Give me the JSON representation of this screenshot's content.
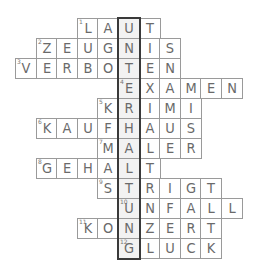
{
  "puzzle": {
    "grid_origin": {
      "x": 15,
      "y": 18
    },
    "cell_size": 20.6,
    "solution_column": 5,
    "solution_word": "UNTERHALTUNG",
    "rows": [
      {
        "number": "1",
        "word": "LAUT",
        "start_col": 3
      },
      {
        "number": "2",
        "word": "ZEUGNIS",
        "start_col": 1
      },
      {
        "number": "3",
        "word": "VERBOTEN",
        "start_col": 0
      },
      {
        "number": "4",
        "word": "EXAMEN",
        "start_col": 5
      },
      {
        "number": "5",
        "word": "KRIMI",
        "start_col": 4
      },
      {
        "number": "6",
        "word": "KAUFHAUS",
        "start_col": 1
      },
      {
        "number": "7",
        "word": "MALER",
        "start_col": 4
      },
      {
        "number": "8",
        "word": "GEHALT",
        "start_col": 1
      },
      {
        "number": "9",
        "word": "STRIGT",
        "start_col": 4
      },
      {
        "number": "10",
        "word": "UNFALL",
        "start_col": 5
      },
      {
        "number": "11",
        "word": "KONZERT",
        "start_col": 3
      },
      {
        "number": "12",
        "word": "GLUCK",
        "start_col": 5
      }
    ]
  },
  "colors": {
    "cell_border": "#9a9a9a",
    "solution_border": "#3a3a3a",
    "letter": "#6a6a6a"
  }
}
